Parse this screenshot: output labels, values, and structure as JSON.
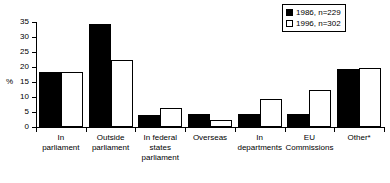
{
  "chart_data": {
    "type": "bar",
    "title": "",
    "xlabel": "",
    "ylabel": "%",
    "ylim": [
      0,
      35
    ],
    "ytick_step": 5,
    "yticks": [
      0,
      5,
      10,
      15,
      20,
      25,
      30,
      35
    ],
    "grid": false,
    "legend_position": "top-right",
    "categories": [
      "In parliament",
      "Outside parliament",
      "In federal states parliament",
      "Overseas",
      "In departments",
      "EU Commissions",
      "Other*"
    ],
    "series": [
      {
        "name": "1986, n=229",
        "color": "#000000",
        "style": "filled",
        "values": [
          18.2,
          34.3,
          4.1,
          4.3,
          4.4,
          4.5,
          19.5
        ]
      },
      {
        "name": "1996, n=302",
        "color": "#ffffff",
        "style": "hollow",
        "values": [
          18.2,
          22.2,
          6.3,
          2.4,
          9.2,
          12.4,
          19.6
        ]
      }
    ]
  },
  "legend": {
    "entries": [
      {
        "label": "1986, n=229",
        "swatch": "filled-square-icon"
      },
      {
        "label": "1996, n=302",
        "swatch": "hollow-square-icon"
      }
    ]
  },
  "axes": {
    "y_title": "%",
    "y_tick_labels": [
      "35",
      "30",
      "25",
      "20",
      "15",
      "10",
      "5",
      "0"
    ],
    "x_tick_labels": [
      "In\nparliament",
      "Outside\nparliament",
      "In federal\nstates\nparliament",
      "Overseas",
      "In\ndepartments",
      "EU\nCommissions",
      "Other*"
    ]
  }
}
